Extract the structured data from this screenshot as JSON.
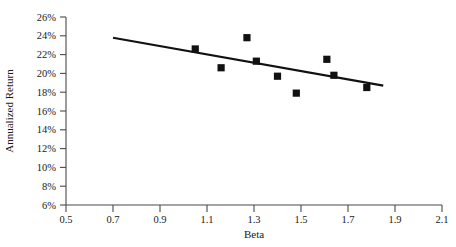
{
  "chart_data": {
    "type": "scatter",
    "title": "",
    "xlabel": "Beta",
    "ylabel": "Annualized Return",
    "xlim": [
      0.5,
      2.1
    ],
    "ylim": [
      6,
      26
    ],
    "grid": false,
    "legend": "none",
    "x_ticks": [
      "0.5",
      "0.7",
      "0.9",
      "1.1",
      "1.3",
      "1.5",
      "1.7",
      "1.9",
      "2.1"
    ],
    "x_tick_values": [
      0.5,
      0.7,
      0.9,
      1.1,
      1.3,
      1.5,
      1.7,
      1.9,
      2.1
    ],
    "y_ticks": [
      "6%",
      "8%",
      "10%",
      "12%",
      "14%",
      "16%",
      "18%",
      "20%",
      "22%",
      "24%",
      "26%"
    ],
    "y_tick_values": [
      6,
      8,
      10,
      12,
      14,
      16,
      18,
      20,
      22,
      24,
      26
    ],
    "points": [
      {
        "x": 1.05,
        "y": 22.6
      },
      {
        "x": 1.16,
        "y": 20.6
      },
      {
        "x": 1.27,
        "y": 23.8
      },
      {
        "x": 1.31,
        "y": 21.3
      },
      {
        "x": 1.4,
        "y": 19.7
      },
      {
        "x": 1.48,
        "y": 17.9
      },
      {
        "x": 1.61,
        "y": 21.5
      },
      {
        "x": 1.64,
        "y": 19.8
      },
      {
        "x": 1.78,
        "y": 18.5
      }
    ],
    "marker_style": "filled-square",
    "marker_color": "#111111",
    "trendline": {
      "x_start": 0.7,
      "y_start": 23.8,
      "x_end": 1.85,
      "y_end": 18.7,
      "color": "#111111"
    }
  }
}
